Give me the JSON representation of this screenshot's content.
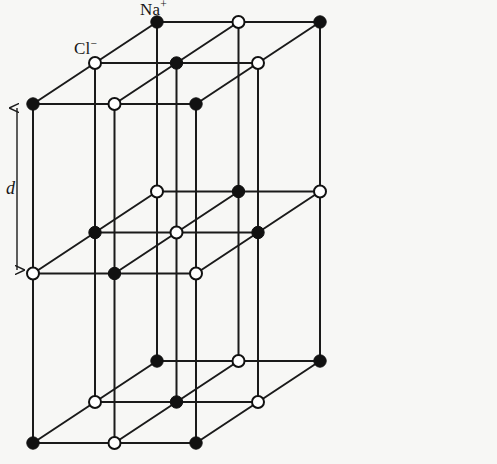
{
  "figure": {
    "name": "sodium-chloride-crystal-lattice",
    "background_color": "#f7f7f5",
    "line_color": "#1a1a1a",
    "width": 497,
    "height": 464
  },
  "labels": {
    "cation": "Na",
    "cation_charge": "+",
    "anion": "Cl",
    "anion_charge": "−",
    "dimension": "d"
  },
  "legend": {
    "filled_marker_meaning": "Na+",
    "open_marker_meaning": "Cl-"
  },
  "chart_data": {
    "type": "scatter",
    "xlabel": "",
    "ylabel": "",
    "projection": "oblique",
    "grid": true,
    "lattice": {
      "nodes_per_axis": 3,
      "origin_px": [
        33,
        443
      ],
      "x_step_px": [
        81.5,
        0
      ],
      "y_step_px": [
        0,
        -169.5
      ],
      "z_step_px": [
        62,
        -41
      ],
      "parity_rule": "even sum of (i+j+k) renders filled Na+ ; odd renders open Cl-",
      "marker_radius_filled_px": 6.2,
      "marker_radius_open_px": 6.0,
      "edge_width_px": 2.0
    },
    "series": [
      {
        "name": "Na+",
        "marker": "filled-circle",
        "color": "#111111",
        "count": 14
      },
      {
        "name": "Cl-",
        "marker": "open-circle",
        "color": "#ffffff",
        "edge_color": "#111111",
        "count": 13
      }
    ],
    "annotations": [
      {
        "text": "Na+",
        "target_node": [
          2,
          2,
          2
        ],
        "position_px": [
          158,
          22
        ]
      },
      {
        "text": "Cl-",
        "target_node": [
          1,
          2,
          1
        ],
        "position_px": [
          96,
          63
        ]
      },
      {
        "text": "d",
        "kind": "double-headed-arrow",
        "meaning": "interionic lattice spacing along the vertical cube edge",
        "from_px": [
          17,
          108
        ],
        "to_px": [
          17,
          270
        ]
      }
    ]
  }
}
